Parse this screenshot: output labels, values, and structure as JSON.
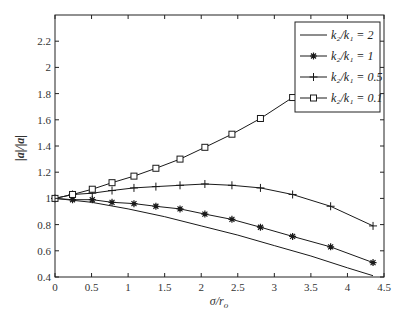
{
  "chart_data": {
    "type": "line",
    "title": "",
    "xlabel": "σ/r_o",
    "ylabel": "|a|/|a|",
    "xlim": [
      0,
      4.5
    ],
    "ylim": [
      0.4,
      2.4
    ],
    "xticks": [
      0,
      0.5,
      1,
      1.5,
      2,
      2.5,
      3,
      3.5,
      4,
      4.5
    ],
    "xtick_labels": [
      "0",
      "0.5",
      "1",
      "1.5",
      "2",
      "2.5",
      "3",
      "3.5",
      "4",
      "4.5"
    ],
    "yticks": [
      0.4,
      0.6,
      0.8,
      1.0,
      1.2,
      1.4,
      1.6,
      1.8,
      2.0,
      2.2
    ],
    "ytick_labels": [
      "0.4",
      "0.6",
      "0.8",
      "1",
      "1.2",
      "1.4",
      "1.6",
      "1.8",
      "2",
      "2.2"
    ],
    "grid": false,
    "legend_position": "upper right",
    "series": [
      {
        "name": "k2/k1 = 2",
        "marker": "none",
        "x": [
          0,
          0.5,
          1.0,
          1.5,
          2.0,
          2.5,
          3.0,
          3.5,
          4.0,
          4.35
        ],
        "y": [
          1.0,
          0.97,
          0.92,
          0.86,
          0.79,
          0.72,
          0.64,
          0.56,
          0.47,
          0.41
        ]
      },
      {
        "name": "k2/k1 = 1",
        "marker": "asterisk",
        "x": [
          0,
          0.24,
          0.51,
          0.78,
          1.08,
          1.38,
          1.71,
          2.05,
          2.42,
          2.81,
          3.25,
          3.77,
          4.35
        ],
        "y": [
          1.0,
          0.99,
          0.99,
          0.97,
          0.96,
          0.94,
          0.92,
          0.88,
          0.84,
          0.78,
          0.71,
          0.63,
          0.51
        ]
      },
      {
        "name": "k2/k1 = 0.5",
        "marker": "plus",
        "x": [
          0,
          0.24,
          0.51,
          0.78,
          1.08,
          1.38,
          1.71,
          2.05,
          2.42,
          2.81,
          3.25,
          3.77,
          4.35
        ],
        "y": [
          1.0,
          1.03,
          1.04,
          1.06,
          1.08,
          1.09,
          1.1,
          1.11,
          1.1,
          1.08,
          1.03,
          0.94,
          0.79
        ]
      },
      {
        "name": "k2/k1 = 0.1",
        "marker": "square",
        "x": [
          0,
          0.24,
          0.51,
          0.78,
          1.08,
          1.38,
          1.71,
          2.05,
          2.42,
          2.81,
          3.25,
          3.77,
          4.35
        ],
        "y": [
          1.0,
          1.03,
          1.07,
          1.12,
          1.17,
          1.23,
          1.3,
          1.39,
          1.49,
          1.61,
          1.77,
          1.96,
          2.2
        ]
      }
    ]
  },
  "legend": {
    "entries": [
      {
        "label": "k₂/k₁ = 2"
      },
      {
        "label": "k₂/k₁ = 1"
      },
      {
        "label": "k₂/k₁ = 0.5"
      },
      {
        "label": "k₂/k₁ = 0.1"
      }
    ]
  },
  "axes": {
    "xlabel_display": "σ/r",
    "xlabel_sub": "o",
    "ylabel_display": "|a|/|a|"
  },
  "colors": {
    "line": "#1a1a1a",
    "frame": "#222222",
    "background": "#ffffff"
  }
}
